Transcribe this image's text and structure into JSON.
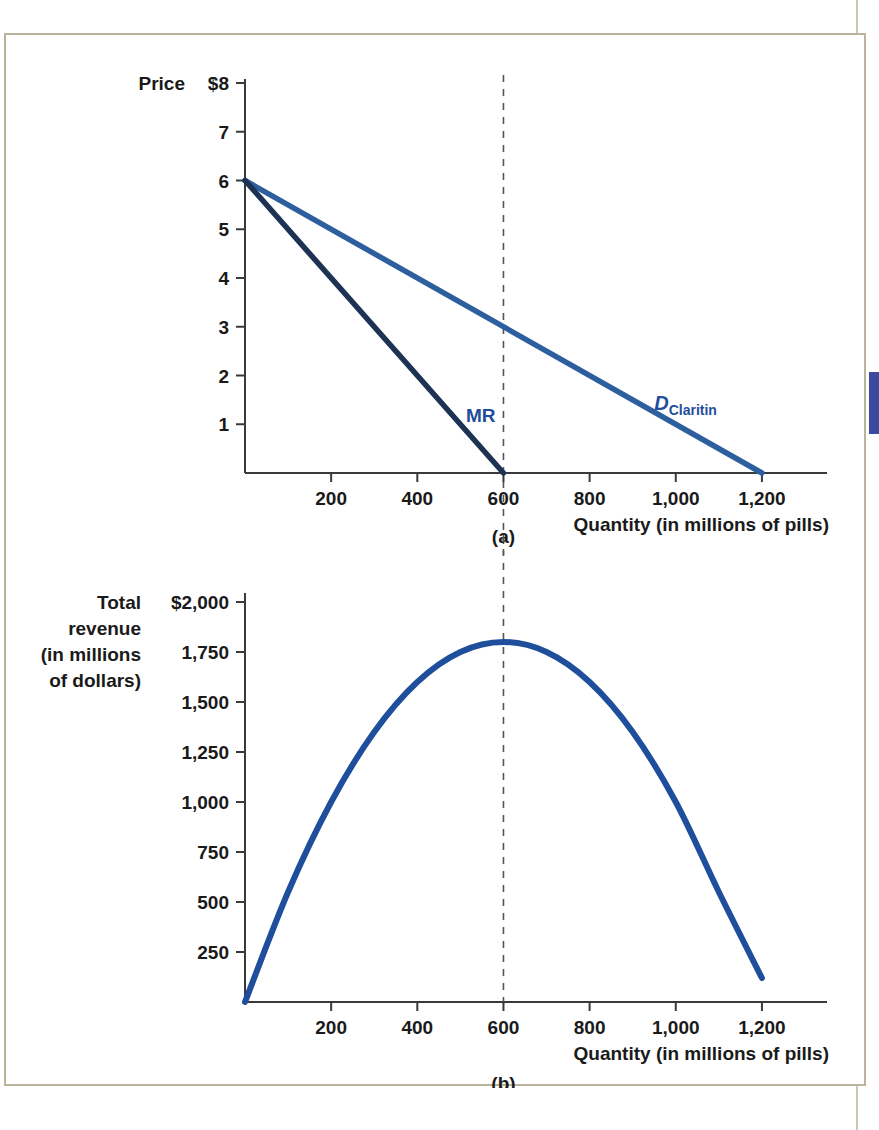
{
  "figure": {
    "panel_a_label": "(a)",
    "panel_b_label": "(b)",
    "accent_demand_color": "#2d5f9e",
    "accent_mr_color": "#1e3254",
    "accent_tr_color": "#1f4e9c",
    "label_color": "#1f4e9c",
    "frame_color": "#b9b49a",
    "tab_color": "#3b4a9e"
  },
  "chart_data": [
    {
      "type": "line",
      "panel": "(a)",
      "title": "",
      "ylabel": "Price",
      "xlabel": "Quantity (in millions of pills)",
      "y_axis_first_tick_label": "$8",
      "yticks": [
        1,
        2,
        3,
        4,
        5,
        6,
        7,
        8
      ],
      "ytick_labels": [
        "1",
        "2",
        "3",
        "4",
        "5",
        "6",
        "7",
        "$8"
      ],
      "ylim": [
        0,
        8
      ],
      "xticks": [
        200,
        400,
        600,
        800,
        1000,
        1200
      ],
      "xtick_labels": [
        "200",
        "400",
        "600",
        "800",
        "1,000",
        "1,200"
      ],
      "xlim": [
        0,
        1300
      ],
      "grid": false,
      "legend": "none",
      "annotations": [
        {
          "text": "MR",
          "x": 600,
          "y": 1.05
        },
        {
          "text": "D",
          "subscript": "Claritin",
          "x": 950,
          "y": 1.3
        }
      ],
      "vertical_reference_line": {
        "x": 600,
        "style": "dashed"
      },
      "series": [
        {
          "name": "D Claritin",
          "label": "D_Claritin",
          "color": "#2d5f9e",
          "x": [
            0,
            1200
          ],
          "values": [
            6,
            0
          ]
        },
        {
          "name": "MR",
          "label": "MR",
          "color": "#1e3254",
          "x": [
            0,
            600
          ],
          "values": [
            6,
            0
          ]
        }
      ]
    },
    {
      "type": "line",
      "panel": "(b)",
      "title": "",
      "ylabel": "Total revenue (in millions of dollars)",
      "ylabel_lines": [
        "Total",
        "revenue",
        "(in millions",
        "of dollars)"
      ],
      "xlabel": "Quantity (in millions of pills)",
      "y_axis_first_tick_label": "$2,000",
      "yticks": [
        250,
        500,
        750,
        1000,
        1250,
        1500,
        1750,
        2000
      ],
      "ytick_labels": [
        "250",
        "500",
        "750",
        "1,000",
        "1,250",
        "1,500",
        "1,750",
        "$2,000"
      ],
      "ylim": [
        0,
        2000
      ],
      "xticks": [
        200,
        400,
        600,
        800,
        1000,
        1200
      ],
      "xtick_labels": [
        "200",
        "400",
        "600",
        "800",
        "1,000",
        "1,200"
      ],
      "xlim": [
        0,
        1300
      ],
      "grid": false,
      "legend": "none",
      "vertical_reference_line": {
        "x": 600,
        "style": "dashed"
      },
      "series": [
        {
          "name": "Total revenue",
          "color": "#1f4e9c",
          "x": [
            0,
            100,
            200,
            300,
            400,
            500,
            600,
            700,
            800,
            900,
            1000,
            1100,
            1200
          ],
          "values": [
            0,
            550,
            1000,
            1350,
            1600,
            1750,
            1800,
            1750,
            1600,
            1350,
            1000,
            550,
            120
          ]
        }
      ]
    }
  ]
}
